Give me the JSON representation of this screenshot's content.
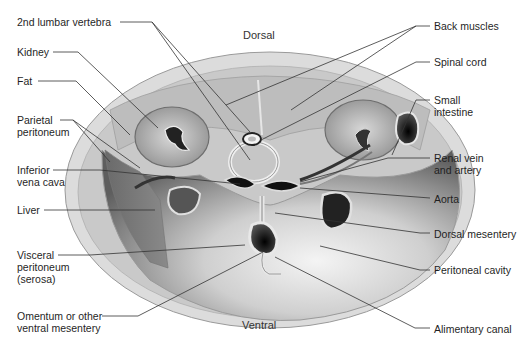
{
  "figure": {
    "type": "anatomical cross-section",
    "orientation": {
      "top": "Dorsal",
      "bottom": "Ventral"
    },
    "colors": {
      "skin_outer": "#d9d9d9",
      "muscle": "#bdbdbd",
      "cavity_dark": "#6a6a6a",
      "cavity_light": "#e6e6e6",
      "organ_dark": "#1a1a1a",
      "leader_line": "#333333"
    }
  },
  "labels_left": [
    {
      "id": "lumbar",
      "text": "2nd lumbar vertebra"
    },
    {
      "id": "kidney",
      "text": "Kidney"
    },
    {
      "id": "fat",
      "text": "Fat"
    },
    {
      "id": "parietal",
      "text": "Parietal\nperitoneum"
    },
    {
      "id": "ivc",
      "text": "Inferior\nvena cava"
    },
    {
      "id": "liver",
      "text": "Liver"
    },
    {
      "id": "visceral",
      "text": "Visceral\nperitoneum\n(serosa)"
    },
    {
      "id": "omentum",
      "text": "Omentum or other\nventral mesentery"
    }
  ],
  "labels_right": [
    {
      "id": "back",
      "text": "Back muscles"
    },
    {
      "id": "spinal",
      "text": "Spinal cord"
    },
    {
      "id": "small",
      "text": "Small\nintestine"
    },
    {
      "id": "renal",
      "text": "Renal vein\nand artery"
    },
    {
      "id": "aorta",
      "text": "Aorta"
    },
    {
      "id": "dorsal_mes",
      "text": "Dorsal mesentery"
    },
    {
      "id": "peritoneal",
      "text": "Peritoneal cavity"
    },
    {
      "id": "alimentary",
      "text": "Alimentary canal"
    }
  ]
}
